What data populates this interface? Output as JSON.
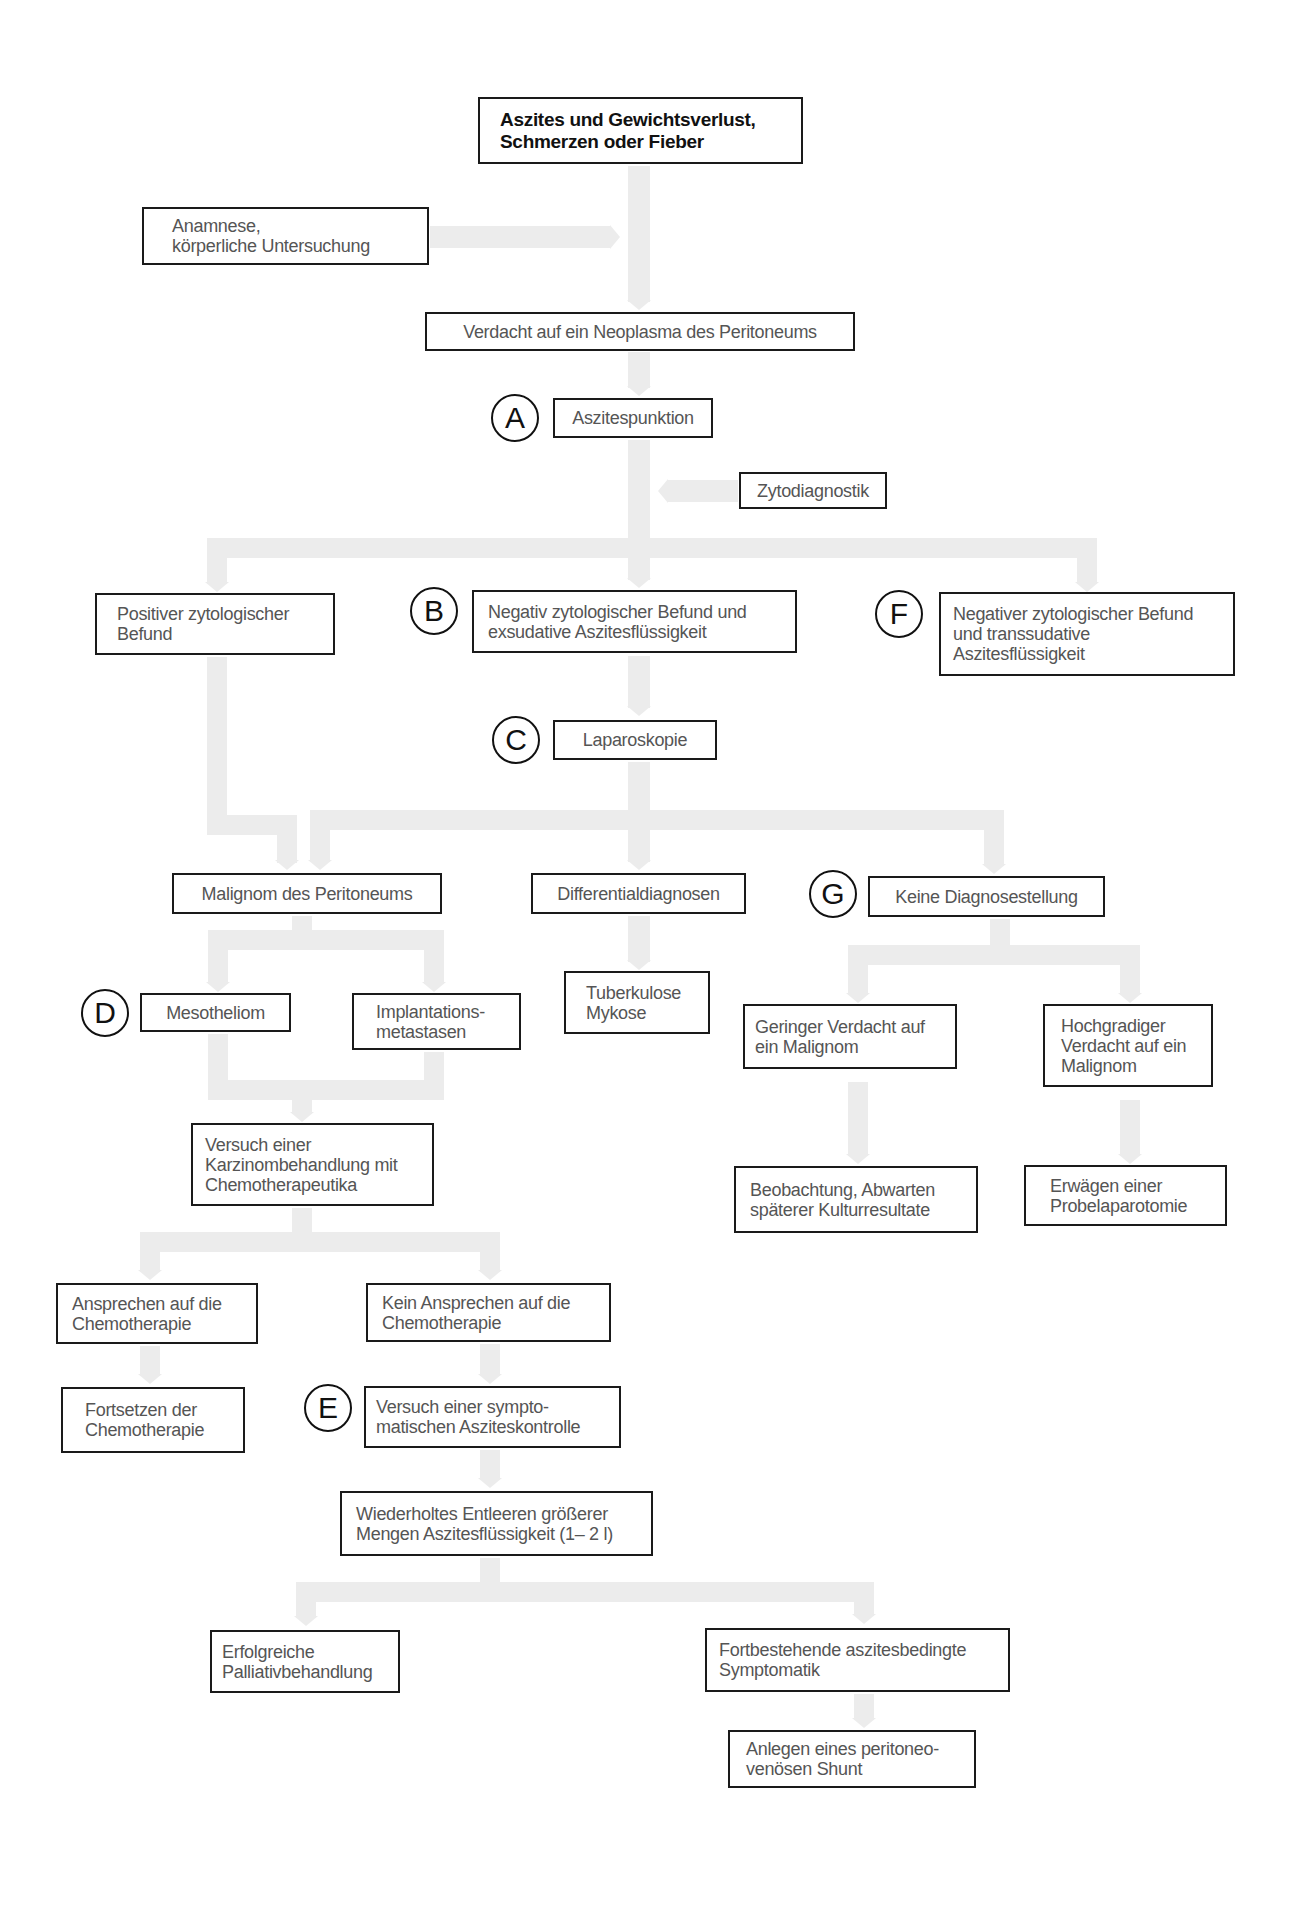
{
  "diagram": {
    "colors": {
      "box_border": "#1a1a1a",
      "text": "#555555",
      "connector": "#ececec"
    },
    "nodes": {
      "start": "Aszites und Gewichtsverlust,\nSchmerzen oder Fieber",
      "anamnese": "Anamnese,\nkörperliche Untersuchung",
      "verdacht": "Verdacht auf ein Neoplasma des Peritoneums",
      "punktion": "Aszitespunktion",
      "zyto": "Zytodiagnostik",
      "positiv": "Positiver zytologischer\nBefund",
      "negativ_exsudat": "Negativ zytologischer Befund und\nexsudative Aszitesflüssigkeit",
      "negativ_transsudat": "Negativer zytologischer Befund\nund transsudative\nAszitesflüssigkeit",
      "laparoskopie": "Laparoskopie",
      "malignom": "Malignom des Peritoneums",
      "differential": "Differentialdiagnosen",
      "keine_diagnose": "Keine Diagnosestellung",
      "mesotheliom": "Mesotheliom",
      "implantation": "Implantations-\nmetastasen",
      "tuberkulose": "Tuberkulose\nMykose",
      "geringer": "Geringer Verdacht auf\nein Malignom",
      "hochgradig": "Hochgradiger\nVerdacht auf ein\nMalignom",
      "karzinom": "Versuch einer\nKarzinombehandlung mit\nChemotherapeutika",
      "beobachtung": "Beobachtung, Abwarten\nspäterer Kulturresultate",
      "probelaparotomie": "Erwägen einer\nProbelaparotomie",
      "ansprechen": "Ansprechen auf die\nChemotherapie",
      "kein_ansprechen": "Kein Ansprechen auf die\nChemotherapie",
      "fortsetzen": "Fortsetzen der\nChemotherapie",
      "symptomatisch": "Versuch einer sympto-\nmatischen Asziteskontrolle",
      "entleeren": "Wiederholtes Entleeren größerer\nMengen Aszitesflüssigkeit (1– 2 l)",
      "erfolgreich": "Erfolgreiche\nPalliativbehandlung",
      "fortbestehend": "Fortbestehende aszitesbedingte\nSymptomatik",
      "shunt": "Anlegen eines peritoneo-\nvenösen Shunt"
    },
    "markers": {
      "A": "A",
      "B": "B",
      "C": "C",
      "D": "D",
      "E": "E",
      "F": "F",
      "G": "G"
    }
  }
}
